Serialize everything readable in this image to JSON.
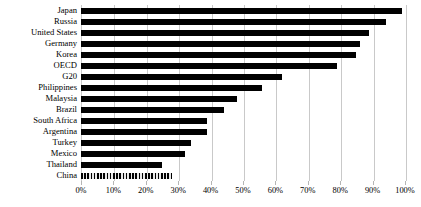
{
  "chart_data": {
    "type": "bar",
    "orientation": "horizontal",
    "title": "",
    "subtitle": "",
    "xlabel": "",
    "ylabel": "",
    "xlim": [
      0,
      100
    ],
    "xtick_values": [
      0,
      10,
      20,
      30,
      40,
      50,
      60,
      70,
      80,
      90,
      100
    ],
    "xtick_labels": [
      "0%",
      "10%",
      "20%",
      "30%",
      "40%",
      "50%",
      "60%",
      "70%",
      "80%",
      "90%",
      "100%"
    ],
    "grid": true,
    "grid_axis": "x",
    "legend": false,
    "legend_position": "none",
    "bar_color": "#000000",
    "highlight_color": "#2b2b2b",
    "gridline_color": "#c9c9c9",
    "categories": [
      "Japan",
      "Russia",
      "United States",
      "Germany",
      "Korea",
      "OECD",
      "G20",
      "Philippines",
      "Malaysia",
      "Brazil",
      "South Africa",
      "Argentina",
      "Turkey",
      "Mexico",
      "Thailand",
      "China"
    ],
    "values": [
      99,
      94,
      89,
      86,
      85,
      79,
      62,
      56,
      48,
      44,
      39,
      39,
      34,
      32,
      25,
      28
    ],
    "bar_styles": [
      "solid",
      "solid",
      "solid",
      "solid",
      "solid",
      "solid",
      "solid",
      "solid",
      "solid",
      "solid",
      "solid",
      "solid",
      "solid",
      "solid",
      "solid",
      "patterned"
    ]
  }
}
